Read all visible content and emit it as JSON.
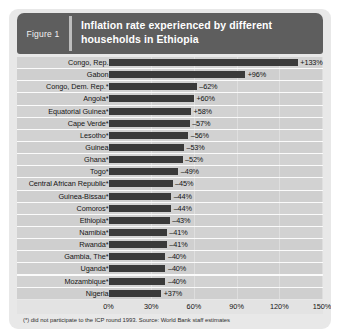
{
  "header": {
    "badge_label": "Figure 1",
    "title": "Inflation rate experienced by different households in Ethiopia"
  },
  "footnote": "(*) did not participate to the ICP round 1993. Source: World Bank staff estimates",
  "colors": {
    "header_bg": "#5e5e5e",
    "card_bg": "#e8e8e8",
    "plot_bg": "#d2d2d2",
    "bar_fill": "#3a3a3a",
    "badge_text": "#f2f2f2",
    "title_text": "#ffffff"
  },
  "chart_data": {
    "type": "bar",
    "orientation": "horizontal",
    "title": "Inflation rate experienced by different households in Ethiopia",
    "xlabel": "",
    "ylabel": "",
    "xlim": [
      0,
      150
    ],
    "xticks": [
      0,
      30,
      60,
      90,
      120,
      150
    ],
    "xtick_labels": [
      "0%",
      "30%",
      "60%",
      "90%",
      "120%",
      "150%"
    ],
    "grid": true,
    "legend": null,
    "value_suffix": "%",
    "categories": [
      "Congo, Rep.",
      "Gabon",
      "Congo, Dem. Rep.*",
      "Angola*",
      "Equatorial Guinea*",
      "Cape Verde*",
      "Lesotho*",
      "Guinea",
      "Ghana*",
      "Togo*",
      "Central African Republic*",
      "Guinea-Bissau*",
      "Comoros*",
      "Ethiopia*",
      "Namibia*",
      "Rwanda*",
      "Gambia, The*",
      "Uganda*",
      "Mozambique*",
      "Nigeria"
    ],
    "values": [
      133,
      96,
      62,
      60,
      58,
      57,
      56,
      53,
      52,
      49,
      45,
      44,
      44,
      43,
      41,
      41,
      40,
      40,
      40,
      37
    ],
    "data_labels": [
      "+133%",
      "+96%",
      "–62%",
      "+60%",
      "+58%",
      "–57%",
      "–56%",
      "–53%",
      "–52%",
      "–49%",
      "–45%",
      "–44%",
      "–44%",
      "–43%",
      "–41%",
      "–41%",
      "–40%",
      "–40%",
      "–40%",
      "+37%"
    ]
  }
}
